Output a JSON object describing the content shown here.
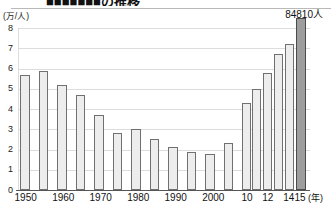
{
  "figure": {
    "title_clipped": "■■■■■■■の推移",
    "peak_callout": "84810人",
    "y_unit_label": "(万/人)",
    "x_unit_label": "(年)"
  },
  "chart_data": {
    "type": "bar",
    "title": "■■■■■■■の推移",
    "xlabel": "(年)",
    "ylabel": "(万/人)",
    "ylim": [
      0,
      8
    ],
    "ytick_labels": [
      "8",
      "7",
      "6",
      "5",
      "4",
      "3",
      "2",
      "1",
      "0"
    ],
    "ytick_values": [
      8,
      7,
      6,
      5,
      4,
      3,
      2,
      1,
      0
    ],
    "grid": true,
    "legend": "none",
    "annotations": [
      {
        "text": "84810人",
        "at_category": "2015",
        "value": 8.481
      }
    ],
    "xtick_labels": [
      {
        "label": "1950",
        "x": 25.7
      },
      {
        "label": "1960",
        "x": 63.3
      },
      {
        "label": "1970",
        "x": 100.7
      },
      {
        "label": "1980",
        "x": 138.3
      },
      {
        "label": "1990",
        "x": 175.7
      },
      {
        "label": "2000",
        "x": 213.3
      },
      {
        "label": "10",
        "x": 247.0
      },
      {
        "label": "12",
        "x": 267.8
      },
      {
        "label": "14",
        "x": 288.8
      },
      {
        "label": "15",
        "x": 300.0
      }
    ],
    "categories": [
      "1950",
      "1955",
      "1960",
      "1965",
      "1970",
      "1975",
      "1980",
      "1985",
      "1990",
      "1995",
      "2000",
      "2005",
      "2010",
      "2011",
      "2012",
      "2013",
      "2014",
      "2015"
    ],
    "values": [
      5.7,
      5.9,
      5.2,
      4.7,
      3.7,
      2.8,
      3.0,
      2.5,
      2.1,
      1.9,
      1.8,
      2.3,
      4.3,
      5.0,
      5.8,
      6.7,
      7.2,
      8.481
    ],
    "bars": [
      {
        "category": "1950",
        "value": 5.7,
        "x": 20.0,
        "w": 9.5,
        "highlight": false
      },
      {
        "category": "1955",
        "value": 5.9,
        "x": 38.5,
        "w": 9.5,
        "highlight": false
      },
      {
        "category": "1960",
        "value": 5.2,
        "x": 57.0,
        "w": 9.5,
        "highlight": false
      },
      {
        "category": "1965",
        "value": 4.7,
        "x": 75.5,
        "w": 9.5,
        "highlight": false
      },
      {
        "category": "1970",
        "value": 3.7,
        "x": 94.0,
        "w": 9.5,
        "highlight": false
      },
      {
        "category": "1975",
        "value": 2.8,
        "x": 112.5,
        "w": 9.5,
        "highlight": false
      },
      {
        "category": "1980",
        "value": 3.0,
        "x": 131.0,
        "w": 9.5,
        "highlight": false
      },
      {
        "category": "1985",
        "value": 2.5,
        "x": 149.5,
        "w": 9.5,
        "highlight": false
      },
      {
        "category": "1990",
        "value": 2.1,
        "x": 168.0,
        "w": 9.5,
        "highlight": false
      },
      {
        "category": "1995",
        "value": 1.9,
        "x": 186.5,
        "w": 9.5,
        "highlight": false
      },
      {
        "category": "2000",
        "value": 1.8,
        "x": 205.0,
        "w": 9.5,
        "highlight": false
      },
      {
        "category": "2005",
        "value": 2.3,
        "x": 223.5,
        "w": 9.5,
        "highlight": false
      },
      {
        "category": "2010",
        "value": 4.3,
        "x": 241.5,
        "w": 9.0,
        "highlight": false
      },
      {
        "category": "2011",
        "value": 5.0,
        "x": 252.3,
        "w": 9.0,
        "highlight": false
      },
      {
        "category": "2012",
        "value": 5.8,
        "x": 263.1,
        "w": 9.0,
        "highlight": false
      },
      {
        "category": "2013",
        "value": 6.7,
        "x": 273.9,
        "w": 9.0,
        "highlight": false
      },
      {
        "category": "2014",
        "value": 7.2,
        "x": 284.7,
        "w": 9.0,
        "highlight": false
      },
      {
        "category": "2015",
        "value": 8.481,
        "x": 295.5,
        "w": 10.0,
        "highlight": true
      }
    ],
    "colors": {
      "bar_fill": "#ededed",
      "bar_stroke": "#707070",
      "highlight_fill": "#9e9e9e",
      "highlight_stroke": "#4b4b4b",
      "gridline": "#dcdcdc",
      "axis": "#555555",
      "text": "#111111"
    }
  }
}
